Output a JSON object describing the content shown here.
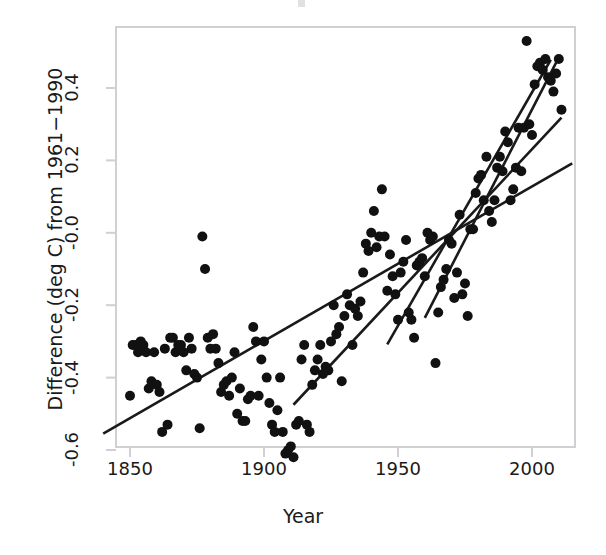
{
  "figure": {
    "background_color": "#ffffff",
    "ink_color": "#1a1a1a",
    "point_color": "#111111"
  },
  "axes": {
    "x_title": "Year",
    "y_title": "Difference (deg C) from 1961−1990",
    "x_ticks": [
      "1850",
      "1900",
      "1950",
      "2000"
    ],
    "y_ticks": [
      "0.4",
      "0.2",
      "-0.0",
      "-0.2",
      "-0.4",
      "-0.6"
    ]
  },
  "chart_data": {
    "type": "scatter",
    "title": "",
    "xlabel": "Year",
    "ylabel": "Difference (deg C) from 1961−1990",
    "xlim": [
      1840,
      2015
    ],
    "ylim": [
      -0.68,
      0.56
    ],
    "grid": false,
    "legend": "none",
    "xticks": [
      1850,
      1900,
      1950,
      2000
    ],
    "yticks": [
      -0.6,
      -0.4,
      -0.2,
      -0.0,
      0.2,
      0.4
    ],
    "marker": "filled-circle",
    "series": [
      {
        "name": "Global temperature anomaly",
        "x": [
          1850,
          1851,
          1852,
          1853,
          1854,
          1855,
          1856,
          1857,
          1858,
          1859,
          1860,
          1861,
          1862,
          1863,
          1864,
          1865,
          1866,
          1867,
          1868,
          1869,
          1870,
          1871,
          1872,
          1873,
          1874,
          1875,
          1876,
          1877,
          1878,
          1879,
          1880,
          1881,
          1882,
          1883,
          1884,
          1885,
          1886,
          1887,
          1888,
          1889,
          1890,
          1891,
          1892,
          1893,
          1894,
          1895,
          1896,
          1897,
          1898,
          1899,
          1900,
          1901,
          1902,
          1903,
          1904,
          1905,
          1906,
          1907,
          1908,
          1909,
          1910,
          1911,
          1912,
          1913,
          1914,
          1915,
          1916,
          1917,
          1918,
          1919,
          1920,
          1921,
          1922,
          1923,
          1924,
          1925,
          1926,
          1927,
          1928,
          1929,
          1930,
          1931,
          1932,
          1933,
          1934,
          1935,
          1936,
          1937,
          1938,
          1939,
          1940,
          1941,
          1942,
          1943,
          1944,
          1945,
          1946,
          1947,
          1948,
          1949,
          1950,
          1951,
          1952,
          1953,
          1954,
          1955,
          1956,
          1957,
          1958,
          1959,
          1960,
          1961,
          1962,
          1963,
          1964,
          1965,
          1966,
          1967,
          1968,
          1969,
          1970,
          1971,
          1972,
          1973,
          1974,
          1975,
          1976,
          1977,
          1978,
          1979,
          1980,
          1981,
          1982,
          1983,
          1984,
          1985,
          1986,
          1987,
          1988,
          1989,
          1990,
          1991,
          1992,
          1993,
          1994,
          1995,
          1996,
          1997,
          1998,
          1999,
          2000,
          2001,
          2002,
          2003,
          2004,
          2005,
          2006,
          2007,
          2008,
          2009,
          2010,
          2011
        ],
        "y": [
          -0.45,
          -0.31,
          -0.31,
          -0.33,
          -0.3,
          -0.31,
          -0.33,
          -0.43,
          -0.41,
          -0.33,
          -0.42,
          -0.44,
          -0.55,
          -0.32,
          -0.53,
          -0.29,
          -0.29,
          -0.33,
          -0.31,
          -0.31,
          -0.33,
          -0.38,
          -0.29,
          -0.32,
          -0.39,
          -0.4,
          -0.54,
          -0.01,
          -0.1,
          -0.29,
          -0.32,
          -0.28,
          -0.32,
          -0.36,
          -0.44,
          -0.42,
          -0.41,
          -0.45,
          -0.4,
          -0.33,
          -0.5,
          -0.43,
          -0.52,
          -0.52,
          -0.46,
          -0.45,
          -0.26,
          -0.3,
          -0.45,
          -0.35,
          -0.3,
          -0.4,
          -0.47,
          -0.53,
          -0.55,
          -0.49,
          -0.4,
          -0.55,
          -0.61,
          -0.6,
          -0.59,
          -0.62,
          -0.53,
          -0.52,
          -0.35,
          -0.31,
          -0.53,
          -0.55,
          -0.42,
          -0.38,
          -0.35,
          -0.31,
          -0.39,
          -0.37,
          -0.38,
          -0.3,
          -0.2,
          -0.28,
          -0.26,
          -0.41,
          -0.23,
          -0.17,
          -0.2,
          -0.31,
          -0.21,
          -0.23,
          -0.19,
          -0.11,
          -0.03,
          -0.05,
          0.0,
          0.06,
          -0.04,
          -0.01,
          0.12,
          -0.01,
          -0.16,
          -0.06,
          -0.12,
          -0.17,
          -0.24,
          -0.11,
          -0.08,
          -0.02,
          -0.22,
          -0.24,
          -0.29,
          -0.09,
          -0.08,
          -0.07,
          -0.12,
          0.0,
          -0.02,
          -0.01,
          -0.36,
          -0.22,
          -0.15,
          -0.13,
          -0.1,
          -0.02,
          -0.03,
          -0.18,
          -0.11,
          0.05,
          -0.17,
          -0.14,
          -0.23,
          0.01,
          0.01,
          0.11,
          0.15,
          0.16,
          0.09,
          0.21,
          0.06,
          0.03,
          0.09,
          0.18,
          0.21,
          0.17,
          0.28,
          0.25,
          0.09,
          0.12,
          0.18,
          0.29,
          0.17,
          0.29,
          0.53,
          0.3,
          0.27,
          0.41,
          0.46,
          0.47,
          0.45,
          0.48,
          0.43,
          0.42,
          0.39,
          0.44,
          0.48,
          0.34
        ]
      }
    ],
    "trend_lines": [
      {
        "name": "full-period-trend",
        "x_start": 1840,
        "y_start": -0.555,
        "x_end": 2015,
        "y_end": 0.192,
        "description": "shallow trend across whole record"
      },
      {
        "name": "mid-period-trend",
        "x_start": 1911,
        "y_start": -0.475,
        "x_end": 2011,
        "y_end": 0.318,
        "description": "trend from about 1911 onward"
      },
      {
        "name": "recent-period-trend",
        "x_start": 1960,
        "y_start": -0.235,
        "x_end": 2009,
        "y_end": 0.47,
        "description": "steepest recent trend from about 1960"
      },
      {
        "name": "late-period-trend",
        "x_start": 1946,
        "y_start": -0.308,
        "x_end": 2007,
        "y_end": 0.478,
        "description": "trend from mid-century"
      }
    ]
  }
}
